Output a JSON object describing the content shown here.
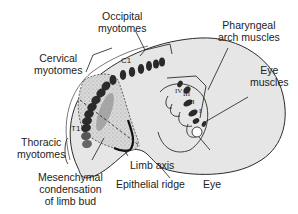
{
  "figure": {
    "labels": {
      "occipital_myotomes": [
        "Occipital",
        "myotomes"
      ],
      "cervical_myotomes": [
        "Cervical",
        "myotomes"
      ],
      "thoracic_myotomes": [
        "Thoracic",
        "myotomes"
      ],
      "pharyngeal_arch_muscles": [
        "Pharyngeal",
        "arch muscles"
      ],
      "eye_muscles": [
        "Eye",
        "muscles"
      ],
      "limb_axis": "Limb axis",
      "epithelial_ridge": "Epithelial ridge",
      "eye": "Eye",
      "mesenchymal_condensation": [
        "Mesenchymal",
        "condensation",
        "of limb bud"
      ]
    },
    "segment_labels": {
      "c1": "C1",
      "t1": "T1"
    },
    "arch_numerals": [
      "IV",
      "III",
      "II",
      "I"
    ],
    "colors": {
      "body_fill": "#e6e6e6",
      "limb_bud_fill": "#cfcfcf",
      "myotome_fill": "#2a2a2a",
      "outline": "#2b2b2b"
    }
  }
}
